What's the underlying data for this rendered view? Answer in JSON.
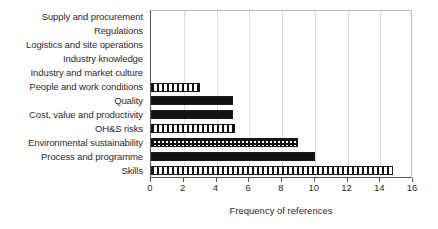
{
  "chart_data": {
    "type": "bar",
    "orientation": "horizontal",
    "title": "",
    "xlabel": "Frequency of references",
    "ylabel": "",
    "xlim": [
      0,
      16
    ],
    "xticks": [
      0,
      2,
      4,
      6,
      8,
      10,
      12,
      14,
      16
    ],
    "xtick_labels": [
      "0",
      "2",
      "4",
      "6",
      "8",
      "10",
      "12",
      "14",
      "16"
    ],
    "grid": "vertical",
    "legend": "none",
    "categories": [
      "Supply and procurement",
      "Regulations",
      "Logistics and site operations",
      "Industry knowledge",
      "Industry and market culture",
      "People and work conditions",
      "Quality",
      "Cost, value and productivity",
      "OH&S risks",
      "Environmental sustainability",
      "Process and programme",
      "Skills"
    ],
    "values": [
      0,
      0,
      0,
      0,
      0,
      3,
      5,
      5,
      5.1,
      9,
      10,
      14.8
    ],
    "bar_fills": [
      "none",
      "none",
      "none",
      "none",
      "none",
      "vertical-stripe",
      "solid",
      "solid",
      "vertical-stripe",
      "checker",
      "solid",
      "vertical-stripe"
    ],
    "colors": {
      "bar_edge": "#1a1a1a",
      "bar_solid": "#111111",
      "bar_background": "#ffffff",
      "axis": "#555555",
      "gridline": "#dcdcdc",
      "text": "#2b2b2b",
      "plot_background": "#ffffff"
    }
  }
}
